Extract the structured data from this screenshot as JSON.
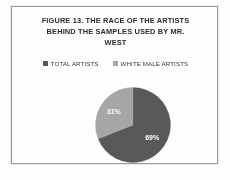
{
  "figure": {
    "title_lines": [
      "FIGURE 13. THE RACE OF THE ARTISTS",
      "BEHIND THE SAMPLES USED BY MR.",
      "WEST"
    ],
    "title_full": "FIGURE 13. THE RACE OF THE ARTISTS BEHIND THE SAMPLES USED BY MR. WEST",
    "border_color": "#9b9b9b",
    "background_color": "#fefefe"
  },
  "legend": {
    "position": "top",
    "items": [
      {
        "label": "TOTAL ARTISTS",
        "color": "#595959"
      },
      {
        "label": "WHITE MALE ARTISTS",
        "color": "#a6a6a6"
      }
    ]
  },
  "chart_data": {
    "type": "pie",
    "title": "FIGURE 13. THE RACE OF THE ARTISTS BEHIND THE SAMPLES USED BY MR. WEST",
    "xlabel": "",
    "ylabel": "",
    "categories": [
      "TOTAL ARTISTS",
      "WHITE MALE ARTISTS"
    ],
    "values": [
      69,
      31
    ],
    "value_unit": "%",
    "data_labels": [
      "69%",
      "31%"
    ],
    "colors": [
      "#595959",
      "#a6a6a6"
    ],
    "start_angle_deg": 0,
    "direction": "clockwise",
    "legend_position": "top",
    "grid": false
  }
}
